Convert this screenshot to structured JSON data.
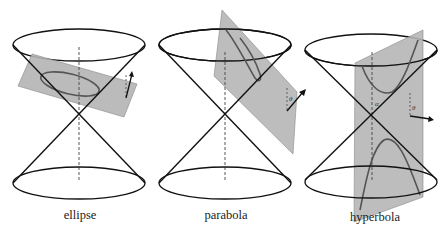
{
  "figure": {
    "plane_fill": "#b4b4b4",
    "curve_color": "#555555",
    "line_color": "#111111",
    "panels": [
      {
        "id": "ellipse",
        "caption": "ellipse",
        "angle_label": "",
        "axis_label": ""
      },
      {
        "id": "parabola",
        "caption": "parabola",
        "angle_label": "θ",
        "axis_label": ""
      },
      {
        "id": "hyperbola",
        "caption": "hyperbola",
        "angle_label": "θ",
        "axis_label": "α"
      }
    ]
  }
}
